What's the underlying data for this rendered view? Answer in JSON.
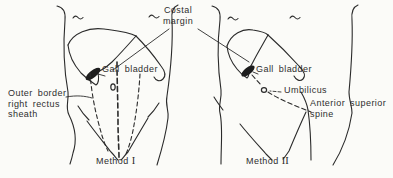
{
  "figure": {
    "type": "anatomical-line-diagram",
    "background_color": "#fbfbf8",
    "ink_color": "#2b2b2b",
    "labels": {
      "costal_margin": {
        "line1": "Costal",
        "line2": "margin"
      },
      "gall_bladder_left": "Gall bladder",
      "gall_bladder_right": "Gall bladder",
      "outer_border": {
        "line1": "Outer border",
        "line2": "right rectus",
        "line3": "sheath"
      },
      "umbilicus": "Umbilicus",
      "anterior_superior_spine": {
        "line1": "Anterior superior",
        "line2": "spine"
      },
      "method1": {
        "name": "Method",
        "numeral": "I"
      },
      "method2": {
        "name": "Method",
        "numeral": "II"
      }
    }
  }
}
